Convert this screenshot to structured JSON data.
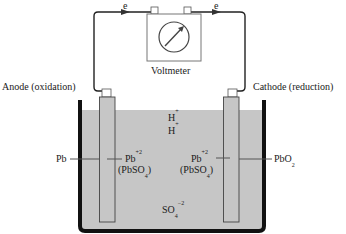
{
  "diagram": {
    "type": "electrochemical-cell",
    "colors": {
      "electrolyte": "#c6c6c6",
      "container_wall": "#111111",
      "wire": "#222222",
      "background": "#ffffff"
    },
    "circuit": {
      "electron_left": {
        "base": "e",
        "sup": "−"
      },
      "electron_right": {
        "base": "e",
        "sup": "−"
      },
      "meter_label": "Voltmeter"
    },
    "electrodes": {
      "anode_label": "Anode (oxidation)",
      "cathode_label": "Cathode (reduction)",
      "anode_material": "Pb",
      "cathode_material": {
        "base": "PbO",
        "sub": "2"
      }
    },
    "ions": {
      "h_plus_1": {
        "base": "H",
        "sup": "+"
      },
      "h_plus_2": {
        "base": "H",
        "sup": "+"
      },
      "anode_product": {
        "base": "Pb",
        "sup": "+2"
      },
      "anode_product_salt": {
        "open": "(PbSO",
        "sub": "4",
        "close": ")"
      },
      "cathode_product": {
        "base": "Pb",
        "sup": "+2"
      },
      "cathode_product_salt": {
        "open": "(PbSO",
        "sub": "4",
        "close": ")"
      },
      "sulfate": {
        "base": "SO",
        "sub": "4",
        "sup": "−2"
      }
    }
  }
}
